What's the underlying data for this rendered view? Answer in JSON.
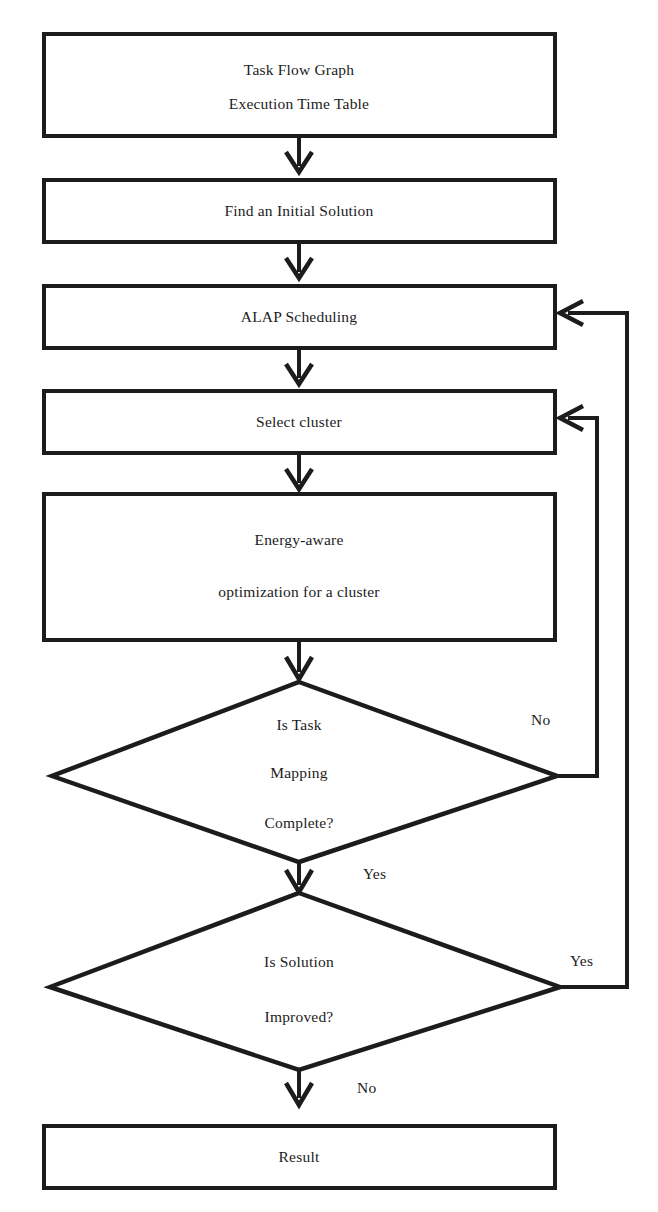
{
  "diagram": {
    "type": "flowchart",
    "background_color": "#ffffff",
    "line_color": "#1c1c1c",
    "text_color": "#1c1c1c"
  },
  "nodes": {
    "input": {
      "shape": "rectangle",
      "line1": "Task Flow Graph",
      "line2": "Execution Time Table"
    },
    "initial_solution": {
      "shape": "rectangle",
      "label": "Find an Initial Solution"
    },
    "alap": {
      "shape": "rectangle",
      "label": "ALAP Scheduling"
    },
    "select_cluster": {
      "shape": "rectangle",
      "label": "Select cluster"
    },
    "optimize": {
      "shape": "rectangle",
      "line1": "Energy-aware",
      "line2": "optimization for a cluster"
    },
    "decision_mapping": {
      "shape": "diamond",
      "line1": "Is Task",
      "line2": "Mapping",
      "line3": "Complete?"
    },
    "decision_improved": {
      "shape": "diamond",
      "line1": "Is Solution",
      "line2": "Improved?"
    },
    "result": {
      "shape": "rectangle",
      "label": "Result"
    }
  },
  "edge_labels": {
    "mapping_no": "No",
    "mapping_yes": "Yes",
    "improved_yes": "Yes",
    "improved_no": "No"
  }
}
